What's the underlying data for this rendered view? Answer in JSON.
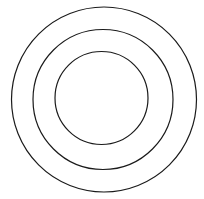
{
  "diagram": {
    "type": "concentric-circles",
    "background": "#ffffff",
    "stroke_color": "#1a1a1a",
    "stroke_width": 1.2,
    "circles": [
      {
        "name": "outer-circle",
        "cx": 104,
        "cy": 99.5,
        "r": 92.5
      },
      {
        "name": "middle-circle",
        "cx": 103,
        "cy": 99.5,
        "r": 70
      },
      {
        "name": "inner-circle",
        "cx": 101.5,
        "cy": 98,
        "r": 46.5
      }
    ]
  }
}
